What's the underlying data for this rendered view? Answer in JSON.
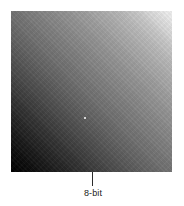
{
  "figure": {
    "caption": "8-bit",
    "swatch_label": "grayscale-gradient-swatch",
    "colors": {
      "gradient_start": "#000000",
      "gradient_end": "#f2f2f2",
      "leader_line": "#2b2b2b",
      "caption_text": "#1a1a1a",
      "background": "#ffffff"
    }
  },
  "chart_data": {
    "type": "heatmap",
    "title": "8-bit",
    "xlabel": "",
    "ylabel": "",
    "gradient": {
      "direction_degrees": 45,
      "from_corner": "bottom-left",
      "to_corner": "top-right",
      "levels": 256,
      "bit_depth": 8
    },
    "stops": [
      {
        "position_pct": 0,
        "gray_level": 0,
        "hex": "#000000"
      },
      {
        "position_pct": 6,
        "gray_level": 10,
        "hex": "#0a0a0a"
      },
      {
        "position_pct": 14,
        "gray_level": 29,
        "hex": "#1d1d1d"
      },
      {
        "position_pct": 23,
        "gray_level": 51,
        "hex": "#333333"
      },
      {
        "position_pct": 32,
        "gray_level": 74,
        "hex": "#4a4a4a"
      },
      {
        "position_pct": 40,
        "gray_level": 94,
        "hex": "#5e5e5e"
      },
      {
        "position_pct": 48,
        "gray_level": 111,
        "hex": "#6f6f6f"
      },
      {
        "position_pct": 56,
        "gray_level": 126,
        "hex": "#7e7e7e"
      },
      {
        "position_pct": 64,
        "gray_level": 141,
        "hex": "#8d8d8d"
      },
      {
        "position_pct": 72,
        "gray_level": 157,
        "hex": "#9d9d9d"
      },
      {
        "position_pct": 80,
        "gray_level": 176,
        "hex": "#b0b0b0"
      },
      {
        "position_pct": 88,
        "gray_level": 198,
        "hex": "#c6c6c6"
      },
      {
        "position_pct": 94,
        "gray_level": 222,
        "hex": "#dedede"
      },
      {
        "position_pct": 100,
        "gray_level": 242,
        "hex": "#f2f2f2"
      }
    ],
    "corner_samples": [
      {
        "corner": "top-left",
        "gray_level": 128,
        "hex": "#808080"
      },
      {
        "corner": "top-right",
        "gray_level": 242,
        "hex": "#f2f2f2"
      },
      {
        "corner": "bottom-left",
        "gray_level": 0,
        "hex": "#000000"
      },
      {
        "corner": "bottom-right",
        "gray_level": 128,
        "hex": "#808080"
      }
    ],
    "annotations": [
      {
        "text": "8-bit",
        "target": "swatch-bottom-edge",
        "leader": true
      }
    ],
    "grid": false,
    "legend": "none"
  }
}
